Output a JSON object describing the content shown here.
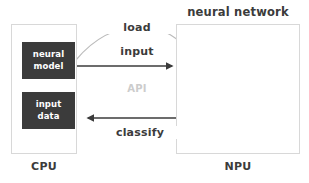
{
  "diagram": {
    "colors": {
      "block_fill": "#3b3b3b",
      "block_text": "#ffffff",
      "panel_border": "#d8d8d8",
      "arrow": "#3b3b3b",
      "curve": "#bbbbbb",
      "muted_text": "#cccccc",
      "body_text": "#3b3b3b",
      "background": "#ffffff"
    },
    "network_title": "neural network",
    "cpu": {
      "caption": "CPU",
      "blocks": [
        {
          "line1": "neural",
          "line2": "model"
        },
        {
          "line1": "input",
          "line2": "data"
        }
      ]
    },
    "npu": {
      "caption": "NPU",
      "network": {
        "layers": [
          2,
          4,
          3,
          2
        ],
        "node_radius": 5.6
      }
    },
    "edges": [
      {
        "id": "load",
        "label": "load",
        "style": "curved",
        "direction": "cpu-to-npu"
      },
      {
        "id": "input",
        "label": "input",
        "style": "straight",
        "direction": "cpu-to-npu"
      },
      {
        "id": "api",
        "label": "API",
        "style": "none",
        "direction": "none"
      },
      {
        "id": "classify",
        "label": "classify",
        "style": "straight",
        "direction": "npu-to-cpu"
      }
    ]
  }
}
